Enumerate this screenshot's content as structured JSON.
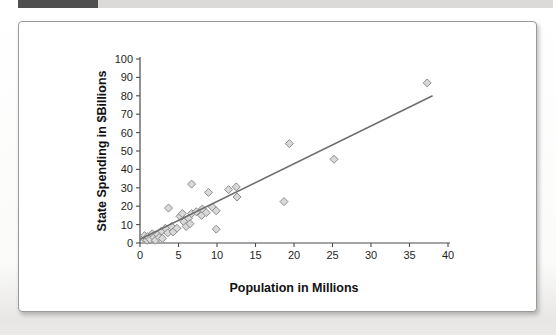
{
  "page": {
    "header": {
      "dark_bar_color": "#4f4f4f",
      "light_bar_color": "#dbdad8"
    }
  },
  "chart_data": {
    "type": "scatter",
    "title": "",
    "xlabel": "Population in Millions",
    "ylabel": "State Spending in $Billions",
    "xlim": [
      0,
      40
    ],
    "ylim": [
      0,
      100
    ],
    "xticks": [
      0,
      5,
      10,
      15,
      20,
      25,
      30,
      35,
      40
    ],
    "yticks": [
      0,
      10,
      20,
      30,
      40,
      50,
      60,
      70,
      80,
      90,
      100
    ],
    "grid": false,
    "points": [
      [
        0.5,
        2.5
      ],
      [
        0.6,
        4
      ],
      [
        0.9,
        1.5
      ],
      [
        1.0,
        3.5
      ],
      [
        1.3,
        2
      ],
      [
        1.6,
        5
      ],
      [
        1.8,
        3
      ],
      [
        2.0,
        1.5
      ],
      [
        2.3,
        4.5
      ],
      [
        2.5,
        3
      ],
      [
        2.8,
        6.5
      ],
      [
        2.9,
        2.5
      ],
      [
        3.3,
        8
      ],
      [
        3.6,
        5.5
      ],
      [
        3.7,
        19
      ],
      [
        4.1,
        9
      ],
      [
        4.3,
        6
      ],
      [
        4.8,
        8
      ],
      [
        5.2,
        14.5
      ],
      [
        5.5,
        16
      ],
      [
        5.7,
        11.5
      ],
      [
        6.0,
        9
      ],
      [
        6.3,
        13.5
      ],
      [
        6.5,
        10.5
      ],
      [
        6.7,
        16
      ],
      [
        6.7,
        32
      ],
      [
        7.3,
        17
      ],
      [
        8.0,
        15
      ],
      [
        8.1,
        18.5
      ],
      [
        8.6,
        16.5
      ],
      [
        8.9,
        27.5
      ],
      [
        9.4,
        19.5
      ],
      [
        9.9,
        17.5
      ],
      [
        9.9,
        7.5
      ],
      [
        11.5,
        29
      ],
      [
        12.5,
        30.5
      ],
      [
        12.6,
        25
      ],
      [
        18.7,
        22.5
      ],
      [
        19.4,
        54
      ],
      [
        25.2,
        45.5
      ],
      [
        37.3,
        87
      ]
    ],
    "trendline": {
      "x_start": 0,
      "y_start": 2,
      "x_end": 38,
      "y_end": 80
    },
    "marker": {
      "shape": "diamond",
      "fill": "#d9d9d9",
      "stroke": "#8c8c8c",
      "size_px": 8
    },
    "trendline_color": "#6e6e6e",
    "axis_color": "#4a4a4a",
    "tick_label_color": "#1f1f1f"
  }
}
